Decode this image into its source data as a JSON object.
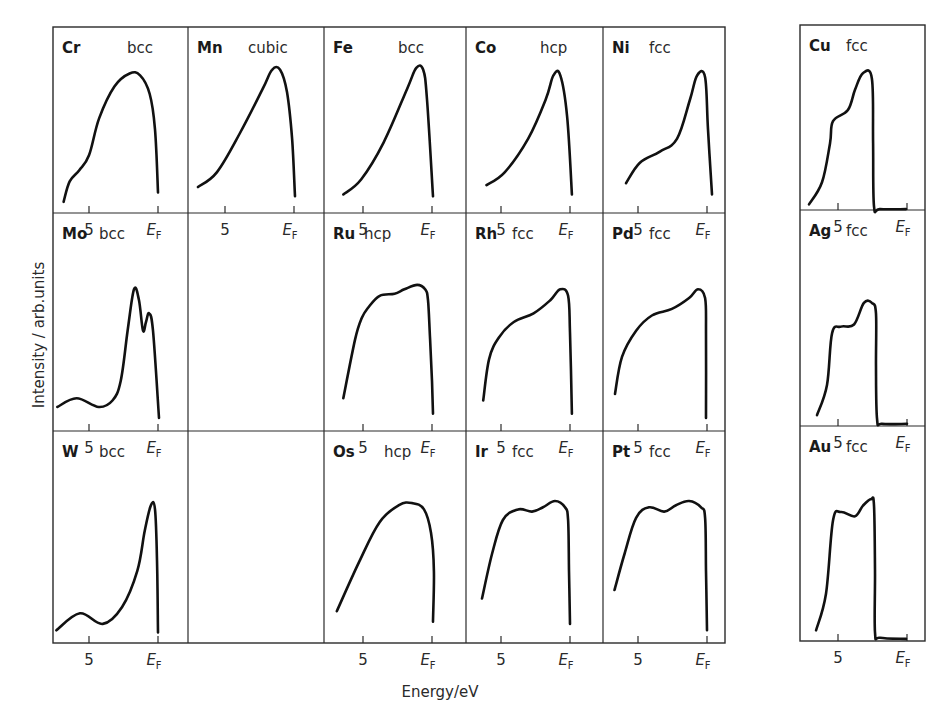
{
  "chart_data": {
    "type": "line",
    "title": "",
    "xlabel": "Energy/eV",
    "ylabel": "Intensity / arb.units",
    "grid": false,
    "x_axis_note": "x values are energy relative to the Fermi level E_F (0); negative = below E_F",
    "tick_labels": {
      "five": "5",
      "fermi_main": "E",
      "fermi_sub": "F"
    },
    "panels": [
      {
        "id": "Cr",
        "element": "Cr",
        "structure": "bcc",
        "group": "main",
        "row": 0,
        "col": 0,
        "points": [
          [
            -6.84,
            0.06
          ],
          [
            -6.4,
            0.17
          ],
          [
            -5.7,
            0.23
          ],
          [
            -5.0,
            0.31
          ],
          [
            -4.26,
            0.51
          ],
          [
            -3.16,
            0.68
          ],
          [
            -2.06,
            0.75
          ],
          [
            -1.3,
            0.74
          ],
          [
            -0.6,
            0.64
          ],
          [
            -0.22,
            0.45
          ],
          [
            0.0,
            0.11
          ]
        ]
      },
      {
        "id": "Mn",
        "element": "Mn",
        "structure": "cubic",
        "group": "main",
        "row": 0,
        "col": 1,
        "points": [
          [
            -6.96,
            0.14
          ],
          [
            -5.58,
            0.22
          ],
          [
            -3.91,
            0.43
          ],
          [
            -2.25,
            0.67
          ],
          [
            -1.59,
            0.77
          ],
          [
            -1.01,
            0.77
          ],
          [
            -0.51,
            0.65
          ],
          [
            -0.14,
            0.4
          ],
          [
            0.07,
            0.09
          ]
        ]
      },
      {
        "id": "Fe",
        "element": "Fe",
        "structure": "bcc",
        "group": "main",
        "row": 0,
        "col": 2,
        "points": [
          [
            -6.43,
            0.1
          ],
          [
            -5.14,
            0.18
          ],
          [
            -3.5,
            0.38
          ],
          [
            -1.79,
            0.67
          ],
          [
            -1.14,
            0.78
          ],
          [
            -0.64,
            0.77
          ],
          [
            -0.36,
            0.61
          ],
          [
            0.07,
            0.09
          ]
        ]
      },
      {
        "id": "Co",
        "element": "Co",
        "structure": "hcp",
        "group": "main",
        "row": 0,
        "col": 3,
        "points": [
          [
            -6.05,
            0.15
          ],
          [
            -4.72,
            0.22
          ],
          [
            -3.03,
            0.4
          ],
          [
            -1.76,
            0.61
          ],
          [
            -1.2,
            0.74
          ],
          [
            -0.7,
            0.74
          ],
          [
            -0.21,
            0.52
          ],
          [
            0.14,
            0.1
          ]
        ]
      },
      {
        "id": "Ni",
        "element": "Ni",
        "structure": "fcc",
        "group": "main",
        "row": 0,
        "col": 4,
        "points": [
          [
            -5.87,
            0.16
          ],
          [
            -4.86,
            0.27
          ],
          [
            -3.41,
            0.33
          ],
          [
            -2.17,
            0.4
          ],
          [
            -1.23,
            0.61
          ],
          [
            -0.72,
            0.74
          ],
          [
            -0.14,
            0.73
          ],
          [
            0.07,
            0.45
          ],
          [
            0.36,
            0.1
          ]
        ]
      },
      {
        "id": "Cu",
        "element": "Cu",
        "structure": "fcc",
        "group": "side",
        "row": 0,
        "col": 0,
        "points": [
          [
            -7.1,
            0.03
          ],
          [
            -6.16,
            0.15
          ],
          [
            -5.58,
            0.36
          ],
          [
            -5.36,
            0.48
          ],
          [
            -4.28,
            0.54
          ],
          [
            -3.77,
            0.65
          ],
          [
            -3.19,
            0.74
          ],
          [
            -2.54,
            0.71
          ],
          [
            -2.46,
            0.36
          ],
          [
            -2.39,
            0.02
          ],
          [
            -1.96,
            0.005
          ],
          [
            -0.07,
            0.005
          ]
        ]
      },
      {
        "id": "Mo",
        "element": "Mo",
        "structure": "bcc",
        "group": "main",
        "row": 1,
        "col": 0,
        "points": [
          [
            -7.3,
            0.11
          ],
          [
            -5.9,
            0.15
          ],
          [
            -4.3,
            0.11
          ],
          [
            -3.3,
            0.14
          ],
          [
            -2.7,
            0.23
          ],
          [
            -2.2,
            0.46
          ],
          [
            -1.74,
            0.65
          ],
          [
            -1.38,
            0.6
          ],
          [
            -1.09,
            0.46
          ],
          [
            -0.87,
            0.5
          ],
          [
            -0.65,
            0.54
          ],
          [
            -0.36,
            0.46
          ],
          [
            0.07,
            0.06
          ]
        ]
      },
      {
        "id": "Ru",
        "element": "Ru",
        "structure": "hcp",
        "group": "main",
        "row": 1,
        "col": 2,
        "points": [
          [
            -6.43,
            0.15
          ],
          [
            -5.57,
            0.42
          ],
          [
            -5.07,
            0.52
          ],
          [
            -4.57,
            0.57
          ],
          [
            -3.79,
            0.62
          ],
          [
            -2.71,
            0.63
          ],
          [
            -2.0,
            0.65
          ],
          [
            -1.07,
            0.67
          ],
          [
            -0.5,
            0.65
          ],
          [
            -0.29,
            0.6
          ],
          [
            -0.14,
            0.42
          ],
          [
            0.0,
            0.23
          ],
          [
            0.07,
            0.08
          ]
        ]
      },
      {
        "id": "Rh",
        "element": "Rh",
        "structure": "fcc",
        "group": "main",
        "row": 1,
        "col": 3,
        "points": [
          [
            -6.29,
            0.14
          ],
          [
            -5.86,
            0.33
          ],
          [
            -5.14,
            0.43
          ],
          [
            -4.07,
            0.5
          ],
          [
            -2.64,
            0.54
          ],
          [
            -1.43,
            0.6
          ],
          [
            -0.71,
            0.65
          ],
          [
            -0.14,
            0.62
          ],
          [
            0.0,
            0.45
          ],
          [
            0.14,
            0.08
          ]
        ]
      },
      {
        "id": "Pd",
        "element": "Pd",
        "structure": "fcc",
        "group": "main",
        "row": 1,
        "col": 4,
        "points": [
          [
            -6.67,
            0.17
          ],
          [
            -6.16,
            0.34
          ],
          [
            -5.14,
            0.46
          ],
          [
            -3.99,
            0.53
          ],
          [
            -2.54,
            0.56
          ],
          [
            -1.3,
            0.61
          ],
          [
            -0.65,
            0.65
          ],
          [
            -0.14,
            0.61
          ],
          [
            -0.07,
            0.45
          ],
          [
            -0.07,
            0.06
          ]
        ]
      },
      {
        "id": "Ag",
        "element": "Ag",
        "structure": "fcc",
        "group": "side",
        "row": 1,
        "col": 0,
        "points": [
          [
            -6.52,
            0.05
          ],
          [
            -5.8,
            0.19
          ],
          [
            -5.43,
            0.43
          ],
          [
            -4.78,
            0.46
          ],
          [
            -3.84,
            0.47
          ],
          [
            -3.12,
            0.57
          ],
          [
            -2.54,
            0.57
          ],
          [
            -2.25,
            0.52
          ],
          [
            -2.25,
            0.27
          ],
          [
            -2.17,
            0.03
          ],
          [
            -1.81,
            0.01
          ],
          [
            0.0,
            0.01
          ]
        ]
      },
      {
        "id": "W",
        "element": "W",
        "structure": "bcc",
        "group": "main",
        "row": 2,
        "col": 0,
        "points": [
          [
            -7.36,
            0.06
          ],
          [
            -5.66,
            0.14
          ],
          [
            -4.0,
            0.09
          ],
          [
            -2.6,
            0.17
          ],
          [
            -1.5,
            0.34
          ],
          [
            -0.96,
            0.53
          ],
          [
            -0.51,
            0.65
          ],
          [
            -0.22,
            0.63
          ],
          [
            -0.07,
            0.39
          ],
          [
            0.0,
            0.05
          ]
        ]
      },
      {
        "id": "Os",
        "element": "Os",
        "structure": "hcp",
        "group": "main",
        "row": 2,
        "col": 2,
        "points": [
          [
            -6.9,
            0.15
          ],
          [
            -5.3,
            0.38
          ],
          [
            -3.8,
            0.57
          ],
          [
            -2.39,
            0.65
          ],
          [
            -1.45,
            0.66
          ],
          [
            -0.58,
            0.63
          ],
          [
            -0.07,
            0.52
          ],
          [
            0.14,
            0.34
          ],
          [
            0.07,
            0.1
          ]
        ]
      },
      {
        "id": "Ir",
        "element": "Ir",
        "structure": "fcc",
        "group": "main",
        "row": 2,
        "col": 3,
        "points": [
          [
            -6.38,
            0.21
          ],
          [
            -5.65,
            0.42
          ],
          [
            -4.86,
            0.58
          ],
          [
            -3.77,
            0.63
          ],
          [
            -2.75,
            0.62
          ],
          [
            -1.96,
            0.64
          ],
          [
            -1.09,
            0.67
          ],
          [
            -0.36,
            0.64
          ],
          [
            -0.14,
            0.58
          ],
          [
            -0.07,
            0.34
          ],
          [
            0.0,
            0.09
          ]
        ]
      },
      {
        "id": "Pt",
        "element": "Pt",
        "structure": "fcc",
        "group": "main",
        "row": 2,
        "col": 4,
        "points": [
          [
            -6.7,
            0.25
          ],
          [
            -5.98,
            0.42
          ],
          [
            -5.14,
            0.59
          ],
          [
            -4.2,
            0.64
          ],
          [
            -3.1,
            0.62
          ],
          [
            -2.25,
            0.65
          ],
          [
            -1.3,
            0.67
          ],
          [
            -0.43,
            0.64
          ],
          [
            -0.14,
            0.59
          ],
          [
            -0.07,
            0.34
          ],
          [
            0.0,
            0.06
          ]
        ]
      },
      {
        "id": "Au",
        "element": "Au",
        "structure": "fcc",
        "group": "side",
        "row": 2,
        "col": 0,
        "points": [
          [
            -6.59,
            0.05
          ],
          [
            -5.87,
            0.22
          ],
          [
            -5.36,
            0.56
          ],
          [
            -4.78,
            0.6
          ],
          [
            -3.77,
            0.58
          ],
          [
            -3.19,
            0.63
          ],
          [
            -2.61,
            0.66
          ],
          [
            -2.39,
            0.63
          ],
          [
            -2.32,
            0.33
          ],
          [
            -2.32,
            0.04
          ],
          [
            -1.96,
            0.015
          ],
          [
            -0.07,
            0.01
          ]
        ]
      }
    ],
    "tick_panels": [
      {
        "group": "main",
        "row": 0,
        "col": 0
      },
      {
        "group": "main",
        "row": 0,
        "col": 1
      },
      {
        "group": "main",
        "row": 0,
        "col": 2
      },
      {
        "group": "main",
        "row": 0,
        "col": 3
      },
      {
        "group": "main",
        "row": 0,
        "col": 4
      },
      {
        "group": "side",
        "row": 0,
        "col": 0
      },
      {
        "group": "main",
        "row": 1,
        "col": 0
      },
      {
        "group": "main",
        "row": 1,
        "col": 2
      },
      {
        "group": "main",
        "row": 1,
        "col": 3
      },
      {
        "group": "main",
        "row": 1,
        "col": 4
      },
      {
        "group": "side",
        "row": 1,
        "col": 0
      },
      {
        "group": "main",
        "row": 2,
        "col": 0
      },
      {
        "group": "main",
        "row": 2,
        "col": 2
      },
      {
        "group": "main",
        "row": 2,
        "col": 3
      },
      {
        "group": "main",
        "row": 2,
        "col": 4
      },
      {
        "group": "side",
        "row": 2,
        "col": 0
      }
    ]
  }
}
